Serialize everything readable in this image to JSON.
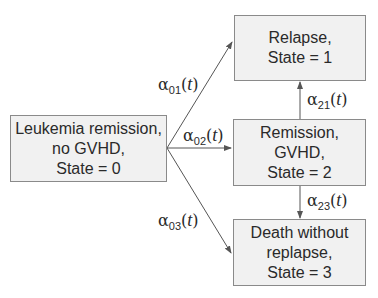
{
  "diagram": {
    "type": "multi-state transition model",
    "states": [
      {
        "id": 0,
        "lines": [
          "Leukemia remission,",
          "no GVHD,",
          "State = 0"
        ]
      },
      {
        "id": 1,
        "lines": [
          "Relapse,",
          "State = 1"
        ]
      },
      {
        "id": 2,
        "lines": [
          "Remission,",
          "GVHD,",
          "State = 2"
        ]
      },
      {
        "id": 3,
        "lines": [
          "Death without",
          "replapse,",
          "State = 3"
        ]
      }
    ],
    "transitions": [
      {
        "from": 0,
        "to": 1,
        "symbol": "α",
        "subscript": "01",
        "arg": "t"
      },
      {
        "from": 0,
        "to": 2,
        "symbol": "α",
        "subscript": "02",
        "arg": "t"
      },
      {
        "from": 0,
        "to": 3,
        "symbol": "α",
        "subscript": "03",
        "arg": "t"
      },
      {
        "from": 2,
        "to": 1,
        "symbol": "α",
        "subscript": "21",
        "arg": "t"
      },
      {
        "from": 2,
        "to": 3,
        "symbol": "α",
        "subscript": "23",
        "arg": "t"
      }
    ],
    "colors": {
      "box_fill": "#f1f1f1",
      "box_border": "#8a8a8a",
      "arrow": "#555555",
      "text": "#2a2a2a"
    }
  }
}
